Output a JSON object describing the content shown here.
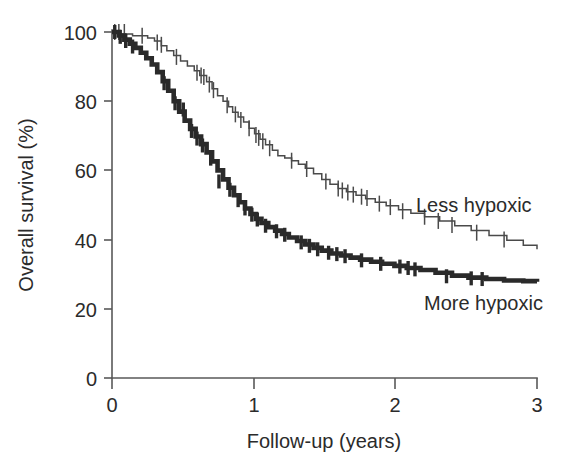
{
  "chart_data": {
    "type": "line",
    "subtype": "kaplan-meier-survival",
    "title": "",
    "xlabel": "Follow-up (years)",
    "ylabel": "Overall survival (%)",
    "xlim": [
      0,
      3.1
    ],
    "ylim": [
      0,
      100
    ],
    "xticks": [
      "0",
      "1",
      "2",
      "3"
    ],
    "xtick_values": [
      0,
      1,
      2,
      3
    ],
    "yticks": [
      "0",
      "20",
      "40",
      "60",
      "80",
      "100"
    ],
    "ytick_values": [
      0,
      20,
      40,
      60,
      80,
      100
    ],
    "grid": false,
    "legend_position": "inline-annotation",
    "series": [
      {
        "name": "Less hypoxic",
        "style": "thin",
        "color": "#4a4a4a",
        "label_x": 2.14,
        "label_y": 51,
        "endpoint_survival": 37,
        "x": [
          0.0,
          0.06,
          0.11,
          0.15,
          0.2,
          0.26,
          0.31,
          0.36,
          0.4,
          0.45,
          0.5,
          0.55,
          0.6,
          0.64,
          0.69,
          0.73,
          0.77,
          0.81,
          0.85,
          0.88,
          0.92,
          0.96,
          1.0,
          1.04,
          1.08,
          1.12,
          1.17,
          1.21,
          1.26,
          1.31,
          1.36,
          1.41,
          1.47,
          1.53,
          1.59,
          1.65,
          1.71,
          1.78,
          1.85,
          1.92,
          2.0,
          2.09,
          2.18,
          2.28,
          2.39,
          2.5,
          2.62,
          2.75,
          2.88,
          3.0,
          3.1
        ],
        "y": [
          100,
          99.4,
          99.4,
          98.9,
          98.9,
          98.3,
          97.4,
          96.0,
          94.6,
          93.2,
          91.6,
          90.2,
          88.8,
          87.4,
          85.6,
          83.6,
          81.6,
          80.0,
          78.4,
          76.8,
          75.4,
          74.0,
          72.2,
          70.6,
          69.0,
          67.4,
          65.8,
          64.2,
          63.6,
          62.8,
          61.8,
          60.6,
          59.0,
          57.4,
          56.0,
          54.8,
          53.8,
          52.8,
          51.8,
          50.8,
          49.8,
          48.6,
          47.6,
          46.6,
          45.4,
          44.0,
          42.6,
          41.2,
          39.8,
          38.4,
          37.2
        ]
      },
      {
        "name": "More hypoxic",
        "style": "thick",
        "color": "#2a2a2a",
        "label_x": 2.2,
        "label_y": 24,
        "endpoint_survival": 28,
        "x": [
          0.0,
          0.05,
          0.09,
          0.13,
          0.17,
          0.21,
          0.25,
          0.29,
          0.33,
          0.37,
          0.41,
          0.45,
          0.49,
          0.53,
          0.57,
          0.61,
          0.65,
          0.69,
          0.73,
          0.77,
          0.81,
          0.85,
          0.89,
          0.93,
          0.97,
          1.01,
          1.05,
          1.09,
          1.14,
          1.19,
          1.24,
          1.29,
          1.35,
          1.41,
          1.47,
          1.53,
          1.6,
          1.67,
          1.74,
          1.81,
          1.89,
          1.97,
          2.06,
          2.15,
          2.25,
          2.36,
          2.48,
          2.6,
          2.73,
          2.86,
          3.0,
          3.1
        ],
        "y": [
          100,
          99.0,
          97.8,
          96.6,
          95.4,
          94.0,
          92.4,
          90.6,
          88.4,
          85.8,
          83.0,
          80.0,
          77.0,
          74.4,
          72.0,
          69.8,
          67.6,
          65.2,
          62.6,
          60.0,
          57.4,
          55.0,
          52.8,
          50.8,
          49.0,
          47.4,
          46.0,
          44.8,
          43.6,
          42.6,
          41.6,
          40.6,
          39.6,
          38.6,
          37.6,
          36.8,
          36.0,
          35.4,
          34.8,
          34.2,
          33.6,
          33.0,
          32.4,
          31.8,
          31.2,
          30.4,
          29.6,
          29.0,
          28.6,
          28.2,
          28.0,
          27.8
        ]
      }
    ],
    "censor_marks": {
      "less_hypoxic": [
        {
          "x": 0.02,
          "y": 100
        },
        {
          "x": 0.05,
          "y": 100
        },
        {
          "x": 0.09,
          "y": 100
        },
        {
          "x": 0.22,
          "y": 98.9
        },
        {
          "x": 0.33,
          "y": 97.0
        },
        {
          "x": 0.36,
          "y": 96.3
        },
        {
          "x": 0.47,
          "y": 92.8
        },
        {
          "x": 0.62,
          "y": 88.2
        },
        {
          "x": 0.65,
          "y": 87.4
        },
        {
          "x": 0.67,
          "y": 87.0
        },
        {
          "x": 0.71,
          "y": 84.8
        },
        {
          "x": 0.74,
          "y": 83.2
        },
        {
          "x": 0.84,
          "y": 78.8
        },
        {
          "x": 0.9,
          "y": 76.2
        },
        {
          "x": 0.94,
          "y": 74.6
        },
        {
          "x": 1.0,
          "y": 72.2
        },
        {
          "x": 1.05,
          "y": 70.2
        },
        {
          "x": 1.07,
          "y": 69.4
        },
        {
          "x": 1.1,
          "y": 68.4
        },
        {
          "x": 1.15,
          "y": 66.4
        },
        {
          "x": 1.31,
          "y": 62.8
        },
        {
          "x": 1.42,
          "y": 60.4
        },
        {
          "x": 1.56,
          "y": 56.8
        },
        {
          "x": 1.65,
          "y": 54.8
        },
        {
          "x": 1.68,
          "y": 54.2
        },
        {
          "x": 1.72,
          "y": 53.6
        },
        {
          "x": 1.76,
          "y": 53.0
        },
        {
          "x": 1.82,
          "y": 52.4
        },
        {
          "x": 1.86,
          "y": 52.0
        },
        {
          "x": 1.95,
          "y": 50.4
        },
        {
          "x": 2.03,
          "y": 49.4
        },
        {
          "x": 2.12,
          "y": 48.2
        },
        {
          "x": 2.28,
          "y": 46.6
        },
        {
          "x": 2.38,
          "y": 45.4
        },
        {
          "x": 2.48,
          "y": 44.2
        },
        {
          "x": 2.66,
          "y": 42.0
        },
        {
          "x": 2.86,
          "y": 40.0
        }
      ],
      "more_hypoxic": [
        {
          "x": 0.02,
          "y": 100
        },
        {
          "x": 0.06,
          "y": 98.6
        },
        {
          "x": 0.1,
          "y": 97.4
        },
        {
          "x": 0.15,
          "y": 95.8
        },
        {
          "x": 0.38,
          "y": 85.2
        },
        {
          "x": 0.46,
          "y": 79.4
        },
        {
          "x": 0.52,
          "y": 77.6
        },
        {
          "x": 0.58,
          "y": 71.4
        },
        {
          "x": 0.62,
          "y": 69.2
        },
        {
          "x": 0.66,
          "y": 67.2
        },
        {
          "x": 0.72,
          "y": 63.4
        },
        {
          "x": 0.78,
          "y": 56.8
        },
        {
          "x": 0.86,
          "y": 54.4
        },
        {
          "x": 0.92,
          "y": 51.4
        },
        {
          "x": 0.97,
          "y": 49.0
        },
        {
          "x": 1.02,
          "y": 47.2
        },
        {
          "x": 1.06,
          "y": 45.8
        },
        {
          "x": 1.12,
          "y": 44.0
        },
        {
          "x": 1.2,
          "y": 42.4
        },
        {
          "x": 1.26,
          "y": 41.4
        },
        {
          "x": 1.38,
          "y": 39.2
        },
        {
          "x": 1.44,
          "y": 38.2
        },
        {
          "x": 1.5,
          "y": 37.2
        },
        {
          "x": 1.58,
          "y": 36.2
        },
        {
          "x": 1.64,
          "y": 35.8
        },
        {
          "x": 1.7,
          "y": 35.2
        },
        {
          "x": 1.82,
          "y": 34.0
        },
        {
          "x": 1.96,
          "y": 33.0
        },
        {
          "x": 2.1,
          "y": 32.2
        },
        {
          "x": 2.16,
          "y": 31.8
        },
        {
          "x": 2.21,
          "y": 31.4
        },
        {
          "x": 2.44,
          "y": 29.4
        },
        {
          "x": 2.62,
          "y": 28.8
        },
        {
          "x": 2.7,
          "y": 28.6
        }
      ]
    }
  },
  "labels": {
    "y_axis_title": "Overall survival (%)",
    "x_axis_title": "Follow-up (years)",
    "series_less": "Less hypoxic",
    "series_more": "More hypoxic",
    "ytick_0": "0",
    "ytick_20": "20",
    "ytick_40": "40",
    "ytick_60": "60",
    "ytick_80": "80",
    "ytick_100": "100",
    "xtick_0": "0",
    "xtick_1": "1",
    "xtick_2": "2",
    "xtick_3": "3"
  },
  "colors": {
    "axis": "#595959",
    "thin_curve": "#4a4a4a",
    "thick_curve": "#2a2a2a",
    "text": "#2b2b2b",
    "background": "#ffffff"
  }
}
